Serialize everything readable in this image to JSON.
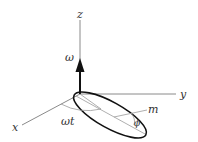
{
  "diagram": {
    "type": "3d-axes-rotating-ellipse",
    "labels": {
      "z_axis": "z",
      "y_axis": "y",
      "x_axis": "x",
      "angular_velocity": "ω",
      "rotation_angle": "ωt",
      "mass": "m",
      "tilt_angle": "ϕ"
    },
    "colors": {
      "axis": "#8a8a8a",
      "arrow": "#111111",
      "ellipse": "#111111",
      "text": "#333333"
    }
  }
}
